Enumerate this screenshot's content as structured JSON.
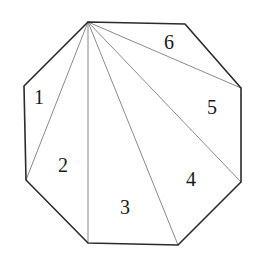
{
  "figure": {
    "shape_name": "octagon",
    "colors": {
      "background": "#ffffff",
      "outline": "#2b2b2b",
      "diagonal": "#8a8a8a",
      "label": "#1a1a1a"
    },
    "outline_width": 1.6,
    "diagonal_width": 1.0,
    "canvas": {
      "width": 256,
      "height": 263
    }
  },
  "polygon": {
    "name": "octagon-outline",
    "points": "88,22 185,24 241,88 241,182 178,245 88,243 26,180 24,86",
    "vertices": [
      {
        "id": "apex",
        "x": 88,
        "y": 22
      },
      {
        "id": "top-right",
        "x": 185,
        "y": 24
      },
      {
        "id": "right-upper",
        "x": 241,
        "y": 88
      },
      {
        "id": "right-lower",
        "x": 241,
        "y": 182
      },
      {
        "id": "bottom-right",
        "x": 178,
        "y": 245
      },
      {
        "id": "bottom-left",
        "x": 88,
        "y": 243
      },
      {
        "id": "left-lower",
        "x": 26,
        "y": 180
      },
      {
        "id": "left-upper",
        "x": 24,
        "y": 86
      }
    ]
  },
  "diagonals": {
    "origin": {
      "x": 88,
      "y": 22
    },
    "lines": [
      {
        "id": "diagonal-to-left-upper",
        "x1": 88,
        "y1": 22,
        "x2": 24,
        "y2": 86
      },
      {
        "id": "diagonal-to-left-lower",
        "x1": 88,
        "y1": 22,
        "x2": 26,
        "y2": 180
      },
      {
        "id": "diagonal-to-bottom-left",
        "x1": 88,
        "y1": 22,
        "x2": 88,
        "y2": 243
      },
      {
        "id": "diagonal-to-bottom-right",
        "x1": 88,
        "y1": 22,
        "x2": 178,
        "y2": 245
      },
      {
        "id": "diagonal-to-right-lower",
        "x1": 88,
        "y1": 22,
        "x2": 241,
        "y2": 182
      },
      {
        "id": "diagonal-to-right-upper",
        "x1": 88,
        "y1": 22,
        "x2": 241,
        "y2": 88
      }
    ]
  },
  "labels": [
    {
      "id": "region-label-1",
      "text": "1",
      "x": 39,
      "y": 99
    },
    {
      "id": "region-label-2",
      "text": "2",
      "x": 63,
      "y": 167
    },
    {
      "id": "region-label-3",
      "text": "3",
      "x": 125,
      "y": 209
    },
    {
      "id": "region-label-4",
      "text": "4",
      "x": 191,
      "y": 181
    },
    {
      "id": "region-label-5",
      "text": "5",
      "x": 212,
      "y": 109
    },
    {
      "id": "region-label-6",
      "text": "6",
      "x": 169,
      "y": 44
    }
  ]
}
